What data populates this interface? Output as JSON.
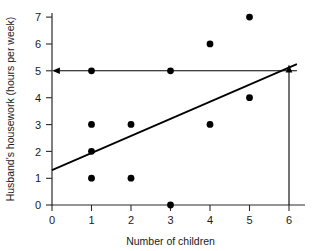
{
  "chart_data": {
    "type": "scatter",
    "title": "",
    "xlabel": "Number of children",
    "ylabel": "Husband's housework (hours per week)",
    "xlim": [
      0,
      6
    ],
    "ylim": [
      0,
      7
    ],
    "xticks": [
      "0",
      "1",
      "2",
      "3",
      "4",
      "5",
      "6"
    ],
    "yticks": [
      "0",
      "1",
      "2",
      "3",
      "4",
      "5",
      "6",
      "7"
    ],
    "grid": false,
    "legend": "none",
    "points": [
      {
        "x": 1,
        "y": 5
      },
      {
        "x": 1,
        "y": 3
      },
      {
        "x": 1,
        "y": 2
      },
      {
        "x": 1,
        "y": 1
      },
      {
        "x": 2,
        "y": 3
      },
      {
        "x": 2,
        "y": 1
      },
      {
        "x": 3,
        "y": 5
      },
      {
        "x": 3,
        "y": 0
      },
      {
        "x": 4,
        "y": 6
      },
      {
        "x": 4,
        "y": 3
      },
      {
        "x": 5,
        "y": 7
      },
      {
        "x": 5,
        "y": 4
      }
    ],
    "regression_line": {
      "x_start": 0,
      "y_start": 1.3,
      "x_end": 6.2,
      "y_end": 5.25
    },
    "annotations": [
      {
        "name": "vertical-prediction-arrow",
        "description": "Arrow from x-axis at 6 children up to regression line",
        "x": 6,
        "y_from": 0,
        "y_to": 5.2,
        "direction": "up"
      },
      {
        "name": "horizontal-prediction-arrow",
        "description": "Arrow from regression line at x=6 leftward to y-axis at 5 hours",
        "y": 5,
        "x_from": 6.2,
        "x_to": 0,
        "direction": "left"
      }
    ],
    "colors": {
      "point": "#000000",
      "regression": "#000000",
      "guide": "#000000",
      "axis": "#2b2b2b",
      "background": "#ffffff"
    }
  },
  "axis": {
    "x_title": "Number of children",
    "y_title": "Husband's housework (hours per week)"
  },
  "x_tick_labels": [
    "0",
    "1",
    "2",
    "3",
    "4",
    "5",
    "6"
  ],
  "y_tick_labels": [
    "0",
    "1",
    "2",
    "3",
    "4",
    "5",
    "6",
    "7"
  ]
}
